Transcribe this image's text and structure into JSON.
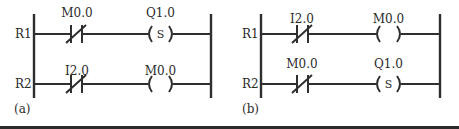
{
  "figure": {
    "panels": [
      {
        "id": "a",
        "caption": "(a)",
        "rungs": [
          {
            "label": "R1",
            "contact": {
              "address": "M0.0",
              "type": "normally-closed"
            },
            "coil": {
              "address": "Q1.0",
              "type": "set",
              "symbol": "S"
            }
          },
          {
            "label": "R2",
            "contact": {
              "address": "I2.0",
              "type": "normally-closed"
            },
            "coil": {
              "address": "M0.0",
              "type": "output",
              "symbol": ""
            }
          }
        ]
      },
      {
        "id": "b",
        "caption": "(b)",
        "rungs": [
          {
            "label": "R1",
            "contact": {
              "address": "I2.0",
              "type": "normally-closed"
            },
            "coil": {
              "address": "M0.0",
              "type": "output",
              "symbol": ""
            }
          },
          {
            "label": "R2",
            "contact": {
              "address": "M0.0",
              "type": "normally-closed"
            },
            "coil": {
              "address": "Q1.0",
              "type": "set",
              "symbol": "S"
            }
          }
        ]
      }
    ]
  },
  "colors": {
    "ink": "#2f2f2f",
    "background": "#ffffff",
    "bottom_band": "#2a2a2a"
  }
}
